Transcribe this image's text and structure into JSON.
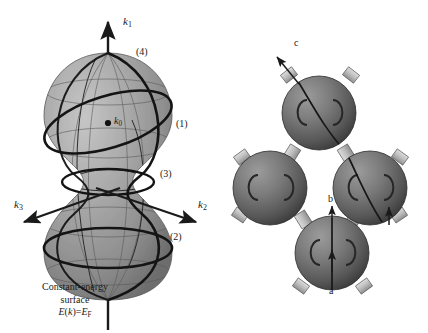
{
  "figure": {
    "background_color": "#ffffff",
    "ink_color": "#1a1a1a",
    "panels": [
      {
        "id": "left-panel",
        "name": "constant-energy-surface-diagram",
        "description": "Hourglass / peanut shaped constant-energy surface in k-space with three k axes and four labelled electron orbits",
        "surface_color_light": "#b9b9b9",
        "surface_color_mid": "#9a9a9a",
        "surface_color_dark": "#6f6f6f"
      },
      {
        "id": "right-panel",
        "name": "copper-fermi-surface-diagram",
        "description": "Four shaded spheres joined by cylindrical necks, labelled a, b and c",
        "sphere_color_light": "#8e8e8e",
        "sphere_color_mid": "#6a6a6a",
        "sphere_color_dark": "#3d3d3d",
        "neck_color": "#c9c9c9"
      }
    ]
  },
  "left_panel": {
    "axes": [
      {
        "name": "k1-axis",
        "label_base": "k",
        "label_sub": "1",
        "direction": "up"
      },
      {
        "name": "k2-axis",
        "label_base": "k",
        "label_sub": "2",
        "direction": "down-right"
      },
      {
        "name": "k3-axis",
        "label_base": "k",
        "label_sub": "3",
        "direction": "down-left"
      }
    ],
    "origin_point": {
      "name": "k0-point",
      "label_base": "k",
      "label_sub": "0"
    },
    "orbit_labels": [
      {
        "name": "orbit-label-1",
        "text": "(1)"
      },
      {
        "name": "orbit-label-2",
        "text": "(2)"
      },
      {
        "name": "orbit-label-3",
        "text": "(3)"
      },
      {
        "name": "orbit-label-4",
        "text": "(4)"
      }
    ],
    "caption": {
      "line1": "Constant-energy",
      "line2": "surface",
      "equation": {
        "lhs_fn": "E",
        "lhs_arg": "k",
        "relation": "=",
        "rhs_base": "E",
        "rhs_sub": "F"
      }
    }
  },
  "right_panel": {
    "labels": [
      {
        "name": "label-a",
        "text": "a"
      },
      {
        "name": "label-b",
        "text": "b"
      },
      {
        "name": "label-c",
        "text": "c"
      }
    ],
    "arrows": [
      {
        "name": "arrow-c",
        "points_to": "upper-left",
        "attached_label": "c"
      },
      {
        "name": "arrow-b",
        "points_to": "up",
        "attached_label": "b"
      },
      {
        "name": "arrow-a",
        "points_to": "up",
        "attached_label": "a"
      },
      {
        "name": "arrow-neck",
        "points_to": "up",
        "attached_label": ""
      }
    ],
    "spheres": [
      {
        "name": "sphere-top",
        "cx": 319,
        "cy": 113,
        "r": 37
      },
      {
        "name": "sphere-left",
        "cx": 270,
        "cy": 188,
        "r": 37
      },
      {
        "name": "sphere-right",
        "cx": 370,
        "cy": 188,
        "r": 37
      },
      {
        "name": "sphere-bottom",
        "cx": 332,
        "cy": 253,
        "r": 37
      }
    ]
  }
}
